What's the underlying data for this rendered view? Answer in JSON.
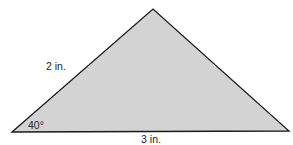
{
  "diagram": {
    "type": "triangle",
    "fill_color": "#d3d3d3",
    "stroke_color": "#1a1a1a",
    "vertices": {
      "left": [
        12,
        132
      ],
      "apex": [
        153,
        9
      ],
      "right": [
        289,
        131
      ]
    },
    "labels": {
      "left_side": "2 in.",
      "base": "3 in.",
      "angle": "40°"
    }
  }
}
